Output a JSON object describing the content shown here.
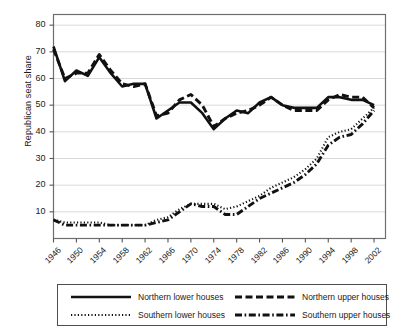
{
  "chart_data": {
    "type": "line",
    "title": "",
    "xlabel": "",
    "ylabel": "Republican seat share",
    "xlim": [
      1946,
      2004
    ],
    "ylim": [
      0,
      84
    ],
    "yticks": [
      10,
      20,
      30,
      40,
      50,
      60,
      70,
      80
    ],
    "xticks": [
      1946,
      1950,
      1954,
      1958,
      1962,
      1966,
      1970,
      1974,
      1978,
      1982,
      1986,
      1990,
      1994,
      1998,
      2002
    ],
    "grid": "horizontal",
    "legend_position": "below-plot",
    "x": [
      1946,
      1948,
      1950,
      1952,
      1954,
      1956,
      1958,
      1960,
      1962,
      1964,
      1966,
      1968,
      1970,
      1972,
      1974,
      1976,
      1978,
      1980,
      1982,
      1984,
      1986,
      1988,
      1990,
      1992,
      1994,
      1996,
      1998,
      2000,
      2002
    ],
    "series": [
      {
        "name": "Northern lower houses",
        "style": "solid",
        "values": [
          72,
          59,
          63,
          61,
          68,
          62,
          57,
          58,
          58,
          45,
          48,
          51,
          51,
          47,
          41,
          45,
          48,
          47,
          51,
          53,
          50,
          49,
          49,
          49,
          53,
          53,
          52,
          52,
          50
        ]
      },
      {
        "name": "Northern upper houses",
        "style": "dashed",
        "values": [
          71,
          60,
          62,
          62,
          69,
          63,
          58,
          57,
          58,
          46,
          47,
          52,
          54,
          50,
          42,
          45,
          47,
          48,
          50,
          53,
          50,
          48,
          48,
          48,
          52,
          54,
          53,
          53,
          49
        ]
      },
      {
        "name": "Southern lower houses",
        "style": "dotted",
        "values": [
          7,
          6,
          6,
          6,
          6,
          5,
          5,
          5,
          5,
          7,
          8,
          11,
          13,
          13,
          13,
          11,
          12,
          14,
          16,
          19,
          21,
          23,
          26,
          30,
          38,
          40,
          41,
          45,
          49
        ]
      },
      {
        "name": "Southern upper houses",
        "style": "dash-dot",
        "values": [
          7,
          5,
          5,
          5,
          5,
          5,
          5,
          5,
          5,
          6,
          7,
          10,
          13,
          12,
          12,
          9,
          9,
          12,
          15,
          17,
          19,
          21,
          24,
          28,
          35,
          38,
          39,
          43,
          48
        ]
      }
    ]
  },
  "axes": {
    "ylabel": "Republican seat share",
    "ytick_labels": [
      "80",
      "70",
      "60",
      "50",
      "40",
      "30",
      "20",
      "10"
    ],
    "xtick_labels": [
      "1946",
      "1950",
      "1954",
      "1958",
      "1962",
      "1966",
      "1970",
      "1974",
      "1978",
      "1982",
      "1986",
      "1990",
      "1994",
      "1998",
      "2002"
    ]
  },
  "legend": {
    "entries": [
      {
        "label": "Northern lower houses",
        "style": "solid"
      },
      {
        "label": "Northern upper houses",
        "style": "dashed"
      },
      {
        "label": "Southern lower houses",
        "style": "dotted"
      },
      {
        "label": "Southern upper houses",
        "style": "dash-dot"
      }
    ]
  },
  "colors": {
    "line": "#111111",
    "grid": "#d9d9d9",
    "axis": "#555555",
    "background": "#ffffff"
  }
}
